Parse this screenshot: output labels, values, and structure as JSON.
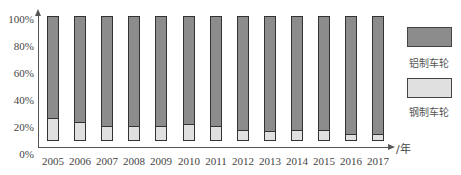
{
  "chart_data": {
    "type": "bar",
    "stacked": true,
    "percent_stacked": true,
    "title": "",
    "xlabel": "/年",
    "ylabel": "",
    "ylim": [
      0,
      100
    ],
    "y_ticks": [
      "0%",
      "20%",
      "40%",
      "60%",
      "80%",
      "100%"
    ],
    "categories": [
      "2005",
      "2006",
      "2007",
      "2008",
      "2009",
      "2010",
      "2011",
      "2012",
      "2013",
      "2014",
      "2015",
      "2016",
      "2017"
    ],
    "series": [
      {
        "name": "钢制车轮",
        "color": "#e0e0e0",
        "values": [
          27,
          24,
          21,
          21,
          21,
          22,
          21,
          18,
          17,
          18,
          18,
          15,
          15
        ]
      },
      {
        "name": "铝制车轮",
        "color": "#8c8c8c",
        "values": [
          73,
          76,
          79,
          79,
          79,
          78,
          79,
          82,
          83,
          82,
          82,
          85,
          85
        ]
      }
    ],
    "legend": {
      "position": "right",
      "entries": [
        "铝制车轮",
        "钢制车轮"
      ]
    },
    "grid": false
  },
  "axis": {
    "x_unit": "/年",
    "y_labels": [
      "100%",
      "80%",
      "60%",
      "40%",
      "20%",
      "0%"
    ]
  },
  "legend": {
    "aluminum": {
      "label": "铝制车轮",
      "color": "#8c8c8c"
    },
    "steel": {
      "label": "钢制车轮",
      "color": "#e0e0e0"
    }
  }
}
